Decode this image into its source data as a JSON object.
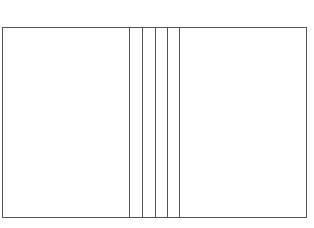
{
  "diagram": {
    "stroke_color": "#555555",
    "background": "#ffffff",
    "outer_box": {
      "x": 2.5,
      "y": 27.5,
      "width": 304,
      "height": 190
    },
    "vertical_lines_x": [
      129.5,
      142.5,
      155.5,
      167.5,
      179.5
    ]
  }
}
